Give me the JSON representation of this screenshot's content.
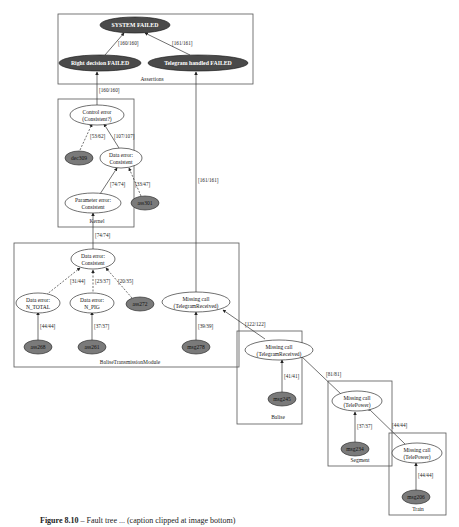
{
  "clusters": {
    "assertions": "Assertions",
    "kernel": "Kernel",
    "btm": "BaliseTransmissionModule",
    "balise": "Balise",
    "segment": "Segment",
    "train": "Train"
  },
  "nodes": {
    "system_failed": "SYSTEM FAILED",
    "right_decision_failed": "Right decision FAILED",
    "telegram_handled_failed": "Telegram handled FAILED",
    "control_error": [
      "Control error",
      "(Consistent?)"
    ],
    "dec309": "dec309",
    "data_error_kernel": [
      "Data error:",
      "Consistent"
    ],
    "param_error": [
      "Parameter error:",
      "Consistent"
    ],
    "ass301": "ass301",
    "data_error_btm": [
      "Data error:",
      "Consistent"
    ],
    "data_error_ntotal": [
      "Data error:",
      "N_TOTAL"
    ],
    "data_error_npig": [
      "Data error:",
      "N_PIG"
    ],
    "ass272": "ass272",
    "ass268": "ass268",
    "ass261": "ass261",
    "missing_call_btm": [
      "Missing call",
      "(TelegramReceived)"
    ],
    "msg278": "msg278",
    "missing_call_balise": [
      "Missing call",
      "(TelegramReceived)"
    ],
    "msg245": "msg245",
    "missing_call_segment": [
      "Missing call",
      "(TelePower)"
    ],
    "msg234": "msg234",
    "missing_call_train": [
      "Missing call",
      "(TelePower)"
    ],
    "msg206": "msg206"
  },
  "edges": {
    "rd_to_sys": "[160/160]",
    "th_to_sys": "[161/161]",
    "ce_to_rd": "[160/160]",
    "dec_to_ce": "[53/62]",
    "dek_to_ce": "[107/107]",
    "pe_to_dek": "[74/74]",
    "ass301_to_dek": "[33/47]",
    "debtm_to_pe": "[74/74]",
    "ntotal_to_debtm": "[31/44]",
    "npig_to_debtm": "[23/37]",
    "ass272_to_debtm": "[20/35]",
    "ass268_to_ntotal": "[44/44]",
    "ass261_to_npig": "[37/37]",
    "mcbtm_to_th": "[161/161]",
    "msg278_to_mcbtm": "[39/39]",
    "mcbal_to_mcbtm": "[122/122]",
    "msg245_to_mcbal": "[41/41]",
    "mcseg_to_mcbal": "[81/81]",
    "msg234_to_mcseg": "[37/37]",
    "mctrain_to_mcseg": "[44/44]",
    "msg206_to_mctrain": "[44/44]"
  },
  "colors": {
    "failed_fill": "#4a4a4a",
    "leaf_fill": "#7a7a7a",
    "ok_fill": "#ffffff"
  },
  "caption": {
    "prefix": "Figure 8.10",
    "text": " –  Fault tree ... (caption clipped at image bottom)"
  }
}
